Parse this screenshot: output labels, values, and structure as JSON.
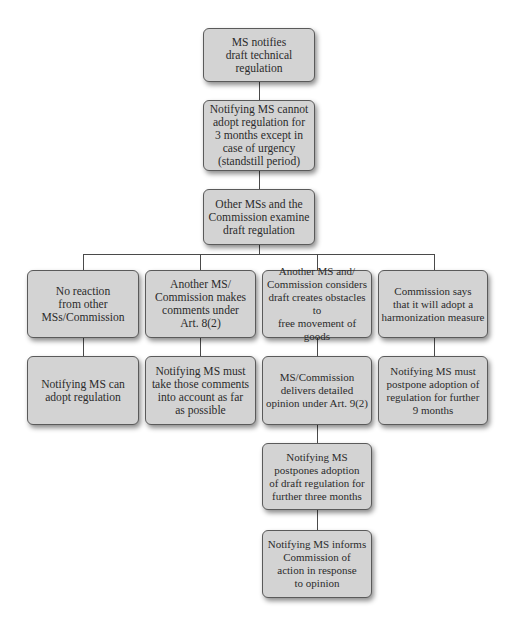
{
  "diagram": {
    "type": "flowchart",
    "nodes": [
      {
        "id": "n1",
        "text": "MS notifies\ndraft technical\nregulation"
      },
      {
        "id": "n2",
        "text": "Notifying MS cannot\nadopt regulation for\n3 months except in\ncase of urgency\n(standstill period)"
      },
      {
        "id": "n3",
        "text": "Other MSs and the\nCommission examine\ndraft regulation"
      },
      {
        "id": "b1",
        "text": "No reaction\nfrom other\nMSs/Commission"
      },
      {
        "id": "b2",
        "text": "Another MS/\nCommission makes\ncomments under\nArt. 8(2)"
      },
      {
        "id": "b3",
        "text": "Another MS and/\nCommission considers\ndraft creates obstacles to\nfree movement of goods"
      },
      {
        "id": "b4",
        "text": "Commission says\nthat it will adopt a\nharmonization measure"
      },
      {
        "id": "r1",
        "text": "Notifying MS can\nadopt regulation"
      },
      {
        "id": "r2",
        "text": "Notifying MS must\ntake those comments\ninto account as far\nas possible"
      },
      {
        "id": "r3",
        "text": "MS/Commission\ndelivers detailed\nopinion under Art. 9(2)"
      },
      {
        "id": "r4",
        "text": "Notifying MS must\npostpone adoption of\nregulation for further\n9 months"
      },
      {
        "id": "n7",
        "text": "Notifying MS\npostpones adoption\nof draft regulation for\nfurther three months"
      },
      {
        "id": "n8",
        "text": "Notifying MS informs\nCommission of\naction in response\nto opinion"
      }
    ],
    "edges": [
      [
        "n1",
        "n2"
      ],
      [
        "n2",
        "n3"
      ],
      [
        "n3",
        "b1"
      ],
      [
        "n3",
        "b2"
      ],
      [
        "n3",
        "b3"
      ],
      [
        "n3",
        "b4"
      ],
      [
        "b1",
        "r1"
      ],
      [
        "b2",
        "r2"
      ],
      [
        "b3",
        "r3"
      ],
      [
        "b4",
        "r4"
      ],
      [
        "r3",
        "n7"
      ],
      [
        "n7",
        "n8"
      ]
    ]
  },
  "colors": {
    "box_fill": "#d3d3d3",
    "box_border": "#5a5a5a",
    "line": "#4a4a4a",
    "text": "#2b2b2b"
  }
}
